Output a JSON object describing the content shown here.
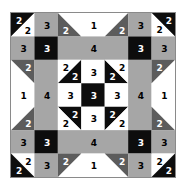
{
  "quilt": {
    "grid_size": 7,
    "colors": {
      "white": "#ffffff",
      "light_gray": "#a6a6a6",
      "dark_gray": "#5c5c5c",
      "black": "#0d0d0d",
      "border": "#8a8a8a"
    },
    "legend_note": "Numbers indicate fabric/patch group per piece",
    "pieces": [
      {
        "id": "r0c0-black",
        "type": "tri",
        "cells": [
          0,
          0
        ],
        "corner": "tl",
        "color": "black",
        "label": "2",
        "lx": 0.3,
        "ly": 0.3,
        "lc": "#ffffff"
      },
      {
        "id": "r0c0-white",
        "type": "tri",
        "cells": [
          0,
          0
        ],
        "corner": "br",
        "color": "white",
        "label": "2",
        "lx": 0.68,
        "ly": 0.72,
        "lc": "#000000"
      },
      {
        "id": "r0c1",
        "type": "rect",
        "r": 0,
        "c": 1,
        "w": 1,
        "h": 1,
        "color": "light_gray",
        "label": "3",
        "lc": "#000000"
      },
      {
        "id": "r0c2-white",
        "type": "tri",
        "cells": [
          0,
          2
        ],
        "corner": "tr",
        "color": "white",
        "label": "",
        "lc": "#000000"
      },
      {
        "id": "r0c2-dg",
        "type": "tri",
        "cells": [
          0,
          2
        ],
        "corner": "bl",
        "color": "dark_gray",
        "label": "2",
        "lx": 0.3,
        "ly": 0.72,
        "lc": "#ffffff"
      },
      {
        "id": "r0c3",
        "type": "rect",
        "r": 0,
        "c": 3,
        "w": 1,
        "h": 1,
        "color": "white",
        "label": "1",
        "lc": "#000000"
      },
      {
        "id": "r0c4-white",
        "type": "tri",
        "cells": [
          0,
          4
        ],
        "corner": "tl",
        "color": "white",
        "label": "",
        "lc": "#000000"
      },
      {
        "id": "r0c4-dg",
        "type": "tri",
        "cells": [
          0,
          4
        ],
        "corner": "br",
        "color": "dark_gray",
        "label": "2",
        "lx": 0.7,
        "ly": 0.72,
        "lc": "#ffffff"
      },
      {
        "id": "r0c5",
        "type": "rect",
        "r": 0,
        "c": 5,
        "w": 1,
        "h": 1,
        "color": "light_gray",
        "label": "3",
        "lc": "#000000"
      },
      {
        "id": "r0c6-black",
        "type": "tri",
        "cells": [
          0,
          6
        ],
        "corner": "tr",
        "color": "black",
        "label": "2",
        "lx": 0.7,
        "ly": 0.3,
        "lc": "#ffffff"
      },
      {
        "id": "r0c6-white",
        "type": "tri",
        "cells": [
          0,
          6
        ],
        "corner": "bl",
        "color": "white",
        "label": "2",
        "lx": 0.3,
        "ly": 0.7,
        "lc": "#000000"
      },
      {
        "id": "r1c0",
        "type": "rect",
        "r": 1,
        "c": 0,
        "w": 1,
        "h": 1,
        "color": "light_gray",
        "label": "3",
        "lc": "#000000"
      },
      {
        "id": "r1c1",
        "type": "rect",
        "r": 1,
        "c": 1,
        "w": 1,
        "h": 1,
        "color": "black",
        "label": "3",
        "lc": "#ffffff"
      },
      {
        "id": "r1c2",
        "type": "rect",
        "r": 1,
        "c": 2,
        "w": 3,
        "h": 1,
        "color": "light_gray",
        "label": "4",
        "lc": "#000000"
      },
      {
        "id": "r1c5",
        "type": "rect",
        "r": 1,
        "c": 5,
        "w": 1,
        "h": 1,
        "color": "black",
        "label": "3",
        "lc": "#ffffff"
      },
      {
        "id": "r1c6",
        "type": "rect",
        "r": 1,
        "c": 6,
        "w": 1,
        "h": 1,
        "color": "light_gray",
        "label": "3",
        "lc": "#000000"
      },
      {
        "id": "r2c0-white",
        "type": "tri",
        "cells": [
          2,
          0
        ],
        "corner": "bl",
        "color": "white",
        "label": "",
        "lc": "#000000"
      },
      {
        "id": "r2c0-dg",
        "type": "tri",
        "cells": [
          2,
          0
        ],
        "corner": "tr",
        "color": "dark_gray",
        "label": "2",
        "lx": 0.7,
        "ly": 0.3,
        "lc": "#ffffff"
      },
      {
        "id": "r3c0",
        "type": "rect",
        "r": 3,
        "c": 0,
        "w": 1,
        "h": 1,
        "color": "white",
        "label": "1",
        "lc": "#000000"
      },
      {
        "id": "r4c0-white",
        "type": "tri",
        "cells": [
          4,
          0
        ],
        "corner": "tl",
        "color": "white",
        "label": "",
        "lc": "#000000"
      },
      {
        "id": "r4c0-dg",
        "type": "tri",
        "cells": [
          4,
          0
        ],
        "corner": "br",
        "color": "dark_gray",
        "label": "2",
        "lx": 0.7,
        "ly": 0.7,
        "lc": "#ffffff"
      },
      {
        "id": "r2c1",
        "type": "rect",
        "r": 2,
        "c": 1,
        "w": 1,
        "h": 3,
        "color": "light_gray",
        "label": "4",
        "lc": "#000000"
      },
      {
        "id": "r2c2-white",
        "type": "tri",
        "cells": [
          2,
          2
        ],
        "corner": "tl",
        "color": "white",
        "label": "2",
        "lx": 0.3,
        "ly": 0.3,
        "lc": "#000000"
      },
      {
        "id": "r2c2-black",
        "type": "tri",
        "cells": [
          2,
          2
        ],
        "corner": "br",
        "color": "black",
        "label": "2",
        "lx": 0.7,
        "ly": 0.7,
        "lc": "#ffffff"
      },
      {
        "id": "r2c3",
        "type": "rect",
        "r": 2,
        "c": 3,
        "w": 1,
        "h": 1,
        "color": "white",
        "label": "3",
        "lc": "#000000"
      },
      {
        "id": "r2c4-black",
        "type": "tri",
        "cells": [
          2,
          4
        ],
        "corner": "bl",
        "color": "black",
        "label": "2",
        "lx": 0.3,
        "ly": 0.7,
        "lc": "#ffffff"
      },
      {
        "id": "r2c4-white",
        "type": "tri",
        "cells": [
          2,
          4
        ],
        "corner": "tr",
        "color": "white",
        "label": "2",
        "lx": 0.7,
        "ly": 0.3,
        "lc": "#000000"
      },
      {
        "id": "r3c2",
        "type": "rect",
        "r": 3,
        "c": 2,
        "w": 1,
        "h": 1,
        "color": "white",
        "label": "3",
        "lc": "#000000"
      },
      {
        "id": "r3c3",
        "type": "rect",
        "r": 3,
        "c": 3,
        "w": 1,
        "h": 1,
        "color": "black",
        "label": "3",
        "lc": "#ffffff"
      },
      {
        "id": "r3c4",
        "type": "rect",
        "r": 3,
        "c": 4,
        "w": 1,
        "h": 1,
        "color": "white",
        "label": "3",
        "lc": "#000000"
      },
      {
        "id": "r4c2-black",
        "type": "tri",
        "cells": [
          4,
          2
        ],
        "corner": "tr",
        "color": "black",
        "label": "2",
        "lx": 0.7,
        "ly": 0.3,
        "lc": "#ffffff"
      },
      {
        "id": "r4c2-white",
        "type": "tri",
        "cells": [
          4,
          2
        ],
        "corner": "bl",
        "color": "white",
        "label": "2",
        "lx": 0.3,
        "ly": 0.7,
        "lc": "#000000"
      },
      {
        "id": "r4c3",
        "type": "rect",
        "r": 4,
        "c": 3,
        "w": 1,
        "h": 1,
        "color": "white",
        "label": "3",
        "lc": "#000000"
      },
      {
        "id": "r4c4-black",
        "type": "tri",
        "cells": [
          4,
          4
        ],
        "corner": "tl",
        "color": "black",
        "label": "2",
        "lx": 0.3,
        "ly": 0.3,
        "lc": "#ffffff"
      },
      {
        "id": "r4c4-white",
        "type": "tri",
        "cells": [
          4,
          4
        ],
        "corner": "br",
        "color": "white",
        "label": "2",
        "lx": 0.7,
        "ly": 0.7,
        "lc": "#000000"
      },
      {
        "id": "r2c5",
        "type": "rect",
        "r": 2,
        "c": 5,
        "w": 1,
        "h": 3,
        "color": "light_gray",
        "label": "4",
        "lc": "#000000"
      },
      {
        "id": "r2c6-white",
        "type": "tri",
        "cells": [
          2,
          6
        ],
        "corner": "br",
        "color": "white",
        "label": "",
        "lc": "#000000"
      },
      {
        "id": "r2c6-dg",
        "type": "tri",
        "cells": [
          2,
          6
        ],
        "corner": "tl",
        "color": "dark_gray",
        "label": "2",
        "lx": 0.3,
        "ly": 0.3,
        "lc": "#ffffff"
      },
      {
        "id": "r3c6",
        "type": "rect",
        "r": 3,
        "c": 6,
        "w": 1,
        "h": 1,
        "color": "white",
        "label": "1",
        "lc": "#000000"
      },
      {
        "id": "r4c6-white",
        "type": "tri",
        "cells": [
          4,
          6
        ],
        "corner": "tr",
        "color": "white",
        "label": "",
        "lc": "#000000"
      },
      {
        "id": "r4c6-dg",
        "type": "tri",
        "cells": [
          4,
          6
        ],
        "corner": "bl",
        "color": "dark_gray",
        "label": "2",
        "lx": 0.3,
        "ly": 0.7,
        "lc": "#ffffff"
      },
      {
        "id": "r5c0",
        "type": "rect",
        "r": 5,
        "c": 0,
        "w": 1,
        "h": 1,
        "color": "light_gray",
        "label": "3",
        "lc": "#000000"
      },
      {
        "id": "r5c1",
        "type": "rect",
        "r": 5,
        "c": 1,
        "w": 1,
        "h": 1,
        "color": "black",
        "label": "3",
        "lc": "#ffffff"
      },
      {
        "id": "r5c2",
        "type": "rect",
        "r": 5,
        "c": 2,
        "w": 3,
        "h": 1,
        "color": "light_gray",
        "label": "4",
        "lc": "#000000"
      },
      {
        "id": "r5c5",
        "type": "rect",
        "r": 5,
        "c": 5,
        "w": 1,
        "h": 1,
        "color": "black",
        "label": "3",
        "lc": "#ffffff"
      },
      {
        "id": "r5c6",
        "type": "rect",
        "r": 5,
        "c": 6,
        "w": 1,
        "h": 1,
        "color": "light_gray",
        "label": "3",
        "lc": "#000000"
      },
      {
        "id": "r6c0-white",
        "type": "tri",
        "cells": [
          6,
          0
        ],
        "corner": "tr",
        "color": "white",
        "label": "2",
        "lx": 0.7,
        "ly": 0.3,
        "lc": "#000000"
      },
      {
        "id": "r6c0-black",
        "type": "tri",
        "cells": [
          6,
          0
        ],
        "corner": "bl",
        "color": "black",
        "label": "2",
        "lx": 0.3,
        "ly": 0.7,
        "lc": "#ffffff"
      },
      {
        "id": "r6c1",
        "type": "rect",
        "r": 6,
        "c": 1,
        "w": 1,
        "h": 1,
        "color": "light_gray",
        "label": "3",
        "lc": "#000000"
      },
      {
        "id": "r6c2-white",
        "type": "tri",
        "cells": [
          6,
          2
        ],
        "corner": "br",
        "color": "white",
        "label": "",
        "lc": "#000000"
      },
      {
        "id": "r6c2-dg",
        "type": "tri",
        "cells": [
          6,
          2
        ],
        "corner": "tl",
        "color": "dark_gray",
        "label": "2",
        "lx": 0.3,
        "ly": 0.3,
        "lc": "#ffffff"
      },
      {
        "id": "r6c3",
        "type": "rect",
        "r": 6,
        "c": 3,
        "w": 1,
        "h": 1,
        "color": "white",
        "label": "1",
        "lc": "#000000"
      },
      {
        "id": "r6c4-white",
        "type": "tri",
        "cells": [
          6,
          4
        ],
        "corner": "bl",
        "color": "white",
        "label": "",
        "lc": "#000000"
      },
      {
        "id": "r6c4-dg",
        "type": "tri",
        "cells": [
          6,
          4
        ],
        "corner": "tr",
        "color": "dark_gray",
        "label": "2",
        "lx": 0.7,
        "ly": 0.3,
        "lc": "#ffffff"
      },
      {
        "id": "r6c5",
        "type": "rect",
        "r": 6,
        "c": 5,
        "w": 1,
        "h": 1,
        "color": "light_gray",
        "label": "3",
        "lc": "#000000"
      },
      {
        "id": "r6c6-white",
        "type": "tri",
        "cells": [
          6,
          6
        ],
        "corner": "tl",
        "color": "white",
        "label": "2",
        "lx": 0.3,
        "ly": 0.3,
        "lc": "#000000"
      },
      {
        "id": "r6c6-black",
        "type": "tri",
        "cells": [
          6,
          6
        ],
        "corner": "br",
        "color": "black",
        "label": "2",
        "lx": 0.7,
        "ly": 0.7,
        "lc": "#ffffff"
      }
    ]
  }
}
